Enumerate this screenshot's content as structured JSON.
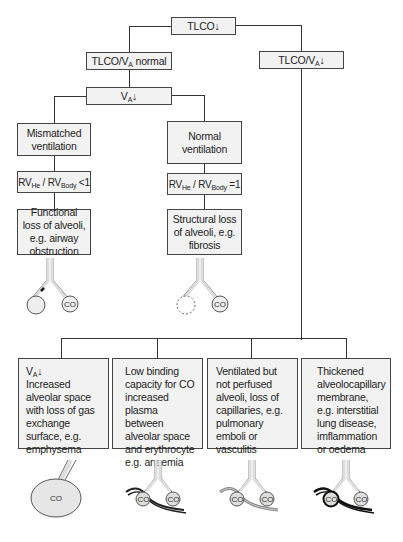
{
  "diagram": {
    "type": "flowchart",
    "root": {
      "label": "TLCO↓"
    },
    "level1": {
      "left": {
        "prefix": "TLCO/V",
        "sub": "A",
        "suffix": " normal"
      },
      "right": {
        "prefix": "TLCO/V",
        "sub": "A",
        "suffix": "↓"
      }
    },
    "va_node": {
      "prefix": "V",
      "sub": "A",
      "suffix": "↓"
    },
    "mismatched": {
      "label": "Mismatched ventilation",
      "ratio": {
        "a": "RV",
        "a_sub": "He",
        "sep": " / RV",
        "b_sub": "Body",
        "suffix": " <1"
      },
      "result": "Functional loss of alveoli, e.g. airway obstruction",
      "illustration": {
        "icon": "airway-obstruction-alveoli-icon",
        "label": "CO"
      }
    },
    "normal": {
      "label": "Normal ventilation",
      "ratio": {
        "a": "RV",
        "a_sub": "He",
        "sep": " / RV",
        "b_sub": "Body",
        "suffix": " =1"
      },
      "result": "Structural loss of alveoli, e.g. fibrosis",
      "illustration": {
        "icon": "lost-alveolus-icon",
        "label": "CO"
      }
    },
    "causes": [
      {
        "head_prefix": "V",
        "head_sub": "A",
        "head_suffix": "↓",
        "text": "Increased alveolar space with loss of gas exchange surface, e.g. emphysema",
        "illustration": {
          "icon": "enlarged-alveolus-icon",
          "label": "CO"
        }
      },
      {
        "text": "Low binding capacity for CO increased plasma between alveolar space and erythrocyte e.g. anaemia",
        "illustration": {
          "icon": "alveoli-capillary-icon",
          "labels": [
            "CO",
            "CO"
          ]
        }
      },
      {
        "text": "Ventilated but not perfused alveoli, loss of capillaries, e.g. pulmonary emboli or vasculitis",
        "illustration": {
          "icon": "unperfused-alveoli-icon",
          "labels": [
            "CO",
            "CO"
          ]
        }
      },
      {
        "text": "Thickened alveolocapillary membrane, e.g. interstitial lung disease, imflammation or oedema",
        "illustration": {
          "icon": "thickened-membrane-icon",
          "labels": [
            "CO",
            "CO"
          ]
        }
      }
    ]
  },
  "colors": {
    "box_fill": "#f2f2f2",
    "line": "#333333",
    "alveolus_fill": "#e6e6e6"
  }
}
